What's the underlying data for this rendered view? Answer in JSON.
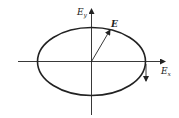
{
  "diagram": {
    "type": "polarization-ellipse",
    "axes": {
      "x_label": "E",
      "x_subscript": "x",
      "y_label": "E",
      "y_subscript": "y"
    },
    "vector_label": "E",
    "colors": {
      "line": "#222222",
      "background": "#ffffff"
    }
  }
}
